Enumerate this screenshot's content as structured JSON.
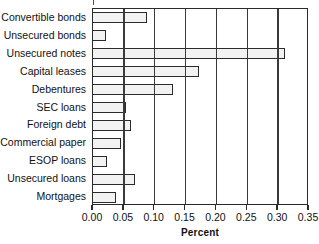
{
  "chart_data": {
    "type": "bar",
    "orientation": "horizontal",
    "title": "",
    "xlabel": "Percent",
    "ylabel": "",
    "xlim": [
      0.0,
      0.35
    ],
    "xticks": [
      "0.00",
      "0.05",
      "0.10",
      "0.15",
      "0.20",
      "0.25",
      "0.30",
      "0.35"
    ],
    "xtick_values": [
      0.0,
      0.05,
      0.1,
      0.15,
      0.2,
      0.25,
      0.3,
      0.35
    ],
    "grid": "vertical",
    "legend": "none",
    "categories": [
      "Convertible bonds",
      "Unsecured bonds",
      "Unsecured notes",
      "Capital leases",
      "Debentures",
      "SEC loans",
      "Foreign debt",
      "Commercial paper",
      "ESOP loans",
      "Unsecured loans",
      "Mortgages"
    ],
    "values": [
      0.088,
      0.021,
      0.311,
      0.171,
      0.129,
      0.054,
      0.062,
      0.045,
      0.023,
      0.068,
      0.037
    ],
    "colors": {
      "bar_fill": "#f2f2f2",
      "bar_edge": "#2b2b2b",
      "axis": "#2b2b2b",
      "grid": "#3a3a3a",
      "text": "#111111",
      "background": "#ffffff"
    }
  }
}
